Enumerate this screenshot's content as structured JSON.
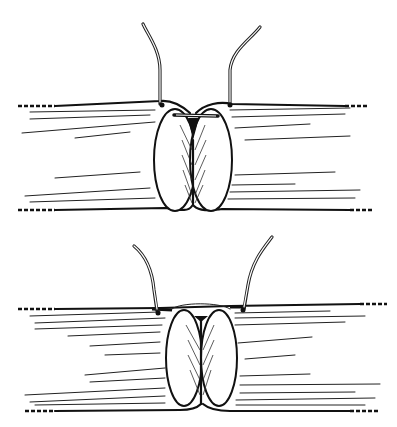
{
  "figure": {
    "background": "#ffffff",
    "ink": "#111111",
    "panels": [
      {
        "id": "top",
        "stage": "sutures placed, vessel ends approximated",
        "y_top": 100,
        "y_bottom": 212,
        "center_x": 193
      },
      {
        "id": "bottom",
        "stage": "sutures tied, ends apposed",
        "y_top": 308,
        "y_bottom": 412,
        "center_x": 200
      }
    ]
  }
}
